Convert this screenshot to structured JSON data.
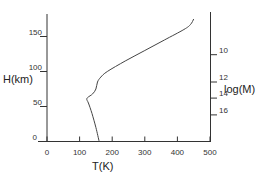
{
  "chart_data": {
    "type": "line",
    "title": "",
    "xlabel": "T(K)",
    "ylabel": "H(km)",
    "ylabel_right": "log(M)",
    "xlim": [
      0,
      500
    ],
    "ylim": [
      0,
      180
    ],
    "grid": false,
    "legend": null,
    "x_ticks": [
      0,
      100,
      200,
      300,
      400,
      500
    ],
    "x_tick_labels": [
      "0",
      "100",
      "200",
      "300",
      "400",
      "500"
    ],
    "y_ticks": [
      0,
      50,
      100,
      150
    ],
    "y_tick_labels": [
      "0",
      "50",
      "100",
      "150"
    ],
    "right_ticks": [
      {
        "label": "10",
        "height_km": 124
      },
      {
        "label": "12",
        "height_km": 85
      },
      {
        "label": "14",
        "height_km": 62
      },
      {
        "label": "16",
        "height_km": 38
      }
    ],
    "series": [
      {
        "name": "Temperature profile",
        "x": [
          160,
          150,
          138,
          127,
          122,
          125,
          140,
          150,
          155,
          165,
          185,
          240,
          300,
          360,
          420,
          440,
          450
        ],
        "y": [
          0,
          20,
          40,
          55,
          60,
          63,
          68,
          75,
          85,
          92,
          100,
          115,
          130,
          145,
          160,
          167,
          175
        ]
      }
    ]
  }
}
